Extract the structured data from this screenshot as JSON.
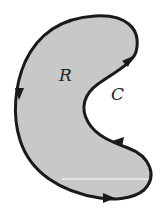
{
  "diagram": {
    "region_label": "R",
    "curve_label": "C",
    "fill_color": "#c8c8c8",
    "stroke_color": "#1a1a1a",
    "orientation": "clockwise-arrows-shown"
  }
}
